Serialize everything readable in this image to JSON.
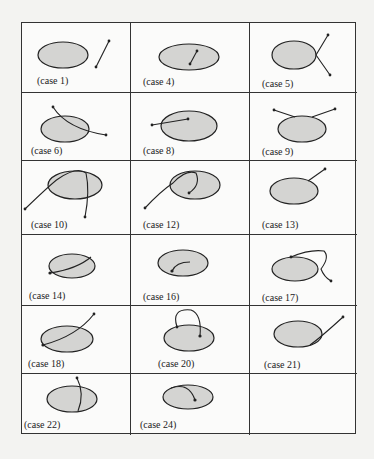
{
  "figure": {
    "cases": [
      {
        "label": "(case 1)"
      },
      {
        "label": "(case 4)"
      },
      {
        "label": "(case 5)"
      },
      {
        "label": "(case 6)"
      },
      {
        "label": "(case 8)"
      },
      {
        "label": "(case 9)"
      },
      {
        "label": "(case 10)"
      },
      {
        "label": "(case 12)"
      },
      {
        "label": "(case 13)"
      },
      {
        "label": "(case 14)"
      },
      {
        "label": "(case 16)"
      },
      {
        "label": "(case 17)"
      },
      {
        "label": "(case 18)"
      },
      {
        "label": "(case 20)"
      },
      {
        "label": "(case 21)"
      },
      {
        "label": "(case 22)"
      },
      {
        "label": "(case 24)"
      },
      {
        "label": ""
      }
    ],
    "colors": {
      "ellipse_fill": "#d4d4d2",
      "stroke": "#222222",
      "border": "#333333"
    }
  }
}
